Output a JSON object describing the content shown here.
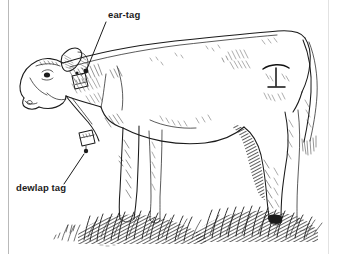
{
  "figure": {
    "background_color": "#ffffff",
    "ink_color": "#1b1b1b",
    "frame": {
      "left_rule_color": "#b9b9b9",
      "right_rule_color": "#e2e2e2"
    }
  },
  "labels": [
    {
      "id": "ear-tag",
      "text": "ear-tag",
      "x": 108,
      "y": 9,
      "leader": {
        "from_x": 106,
        "from_y": 22,
        "to_x": 87,
        "to_y": 70,
        "dot_x": 86,
        "dot_y": 71
      }
    },
    {
      "id": "dewlap-tag",
      "text": "dewlap tag",
      "x": 16,
      "y": 182,
      "leader": {
        "from_x": 64,
        "from_y": 184,
        "to_x": 85,
        "to_y": 153,
        "dot_x": 86,
        "dot_y": 151
      }
    }
  ],
  "subject": {
    "animal": "cow",
    "orientation": "left profile",
    "ground": "grass",
    "marks": [
      {
        "name": "ear-tag",
        "location": "left ear"
      },
      {
        "name": "dewlap-tag",
        "location": "dewlap under neck"
      },
      {
        "name": "brand",
        "location": "left hindquarter"
      }
    ]
  }
}
